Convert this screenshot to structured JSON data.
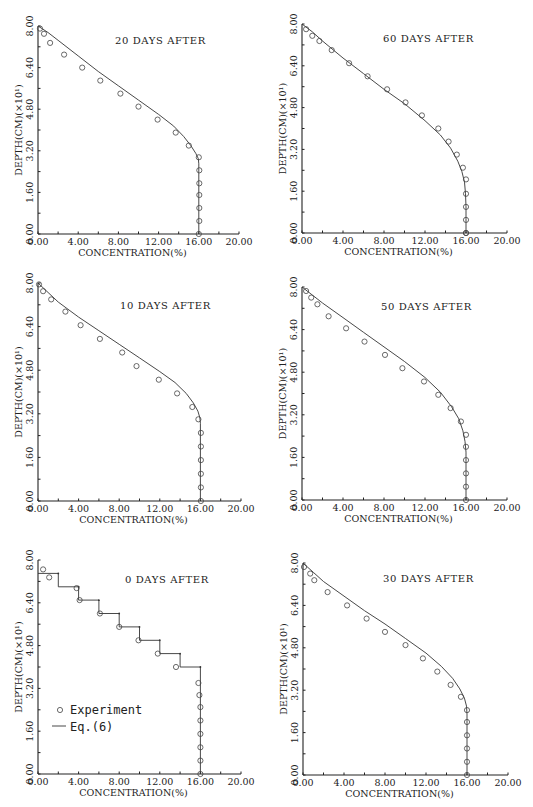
{
  "figure": {
    "legend": {
      "experiment_label": "Experiment",
      "model_label": "Eq.(6)"
    }
  },
  "chart_data": [
    {
      "id": "p20",
      "type": "scatter",
      "title": "20 DAYS AFTER",
      "xlabel": "CONCENTRATION(%)",
      "ylabel": "DEPTH(CM)(×10¹)",
      "xlim": [
        0,
        20
      ],
      "ylim": [
        0,
        8
      ],
      "xticks": [
        "0.00",
        "4.00",
        "8.00",
        "12.00",
        "16.00",
        "20.00"
      ],
      "yticks": [
        "0.00",
        "1.60",
        "3.20",
        "4.80",
        "6.40",
        "8.00"
      ],
      "frame": {
        "x0": 38,
        "x1": 239,
        "y0": 234,
        "y1": 26
      },
      "title_pos": {
        "x": 115,
        "y": 44
      },
      "series": [
        {
          "name": "Eq.(6)",
          "kind": "line",
          "x": [
            0,
            1,
            2,
            4,
            6,
            8,
            10,
            12,
            13.5,
            14.5,
            15.2,
            15.7,
            15.95,
            16,
            16
          ],
          "y": [
            8,
            7.75,
            7.45,
            6.85,
            6.25,
            5.7,
            5.15,
            4.6,
            4.15,
            3.75,
            3.4,
            3.1,
            2.9,
            2.7,
            0
          ]
        },
        {
          "name": "Experiment",
          "kind": "markers",
          "x": [
            0.2,
            0.6,
            1.2,
            2.6,
            4.4,
            6.2,
            8.2,
            10.0,
            11.9,
            13.7,
            15.0,
            16.0,
            16.05,
            16.05,
            16.05,
            16.05,
            16.05,
            16.0
          ],
          "y": [
            7.9,
            7.7,
            7.35,
            6.9,
            6.4,
            5.9,
            5.4,
            4.9,
            4.4,
            3.9,
            3.4,
            2.95,
            2.45,
            1.95,
            1.5,
            1.0,
            0.5,
            0.0
          ]
        }
      ]
    },
    {
      "id": "p60",
      "type": "scatter",
      "title": "60 DAYS AFTER",
      "xlabel": "CONCENTRATION(%)",
      "ylabel": "DEPTH(CM)(×10¹)",
      "xlim": [
        0,
        20
      ],
      "ylim": [
        0,
        8
      ],
      "xticks": [
        "0.00",
        "4.00",
        "8.00",
        "12.00",
        "16.00",
        "20.00"
      ],
      "yticks": [
        "0.00",
        "1.60",
        "3.20",
        "4.80",
        "6.40",
        "8.00"
      ],
      "frame": {
        "x0": 302,
        "x1": 507,
        "y0": 233,
        "y1": 24
      },
      "title_pos": {
        "x": 383,
        "y": 42
      },
      "series": [
        {
          "name": "Eq.(6)",
          "kind": "line",
          "x": [
            0,
            1,
            2,
            4,
            6,
            8,
            10,
            12,
            13.5,
            14.5,
            15.2,
            15.6,
            15.85,
            15.95,
            16,
            16
          ],
          "y": [
            8,
            7.7,
            7.35,
            6.7,
            6.1,
            5.5,
            4.95,
            4.3,
            3.75,
            3.25,
            2.75,
            2.35,
            1.95,
            1.5,
            1.0,
            0
          ]
        },
        {
          "name": "Experiment",
          "kind": "markers",
          "x": [
            0.4,
            1.0,
            1.7,
            2.9,
            4.6,
            6.4,
            8.3,
            10.1,
            11.7,
            13.3,
            14.3,
            15.1,
            15.7,
            16.0,
            16.0,
            16.0,
            16.0,
            16.0,
            16.0
          ],
          "y": [
            7.8,
            7.55,
            7.35,
            7.0,
            6.5,
            6.0,
            5.5,
            5.0,
            4.5,
            4.0,
            3.5,
            3.0,
            2.5,
            2.05,
            1.5,
            1.0,
            0.5,
            0.0,
            0.0
          ]
        }
      ]
    },
    {
      "id": "p10",
      "type": "scatter",
      "title": "10 DAYS AFTER",
      "xlabel": "CONCENTRATION(%)",
      "ylabel": "DEPTH(CM)(×10¹)",
      "xlim": [
        0,
        20
      ],
      "ylim": [
        0,
        8
      ],
      "xticks": [
        "0.00",
        "4.00",
        "8.00",
        "12.00",
        "16.00",
        "20.00"
      ],
      "yticks": [
        "0.00",
        "1.60",
        "3.20",
        "4.80",
        "6.40",
        "8.00"
      ],
      "frame": {
        "x0": 38,
        "x1": 241,
        "y0": 501,
        "y1": 283
      },
      "title_pos": {
        "x": 120,
        "y": 309
      },
      "series": [
        {
          "name": "Eq.(6)",
          "kind": "line",
          "x": [
            0,
            1,
            2,
            4,
            6,
            8,
            10,
            12,
            13.5,
            14.6,
            15.3,
            15.75,
            15.95,
            16,
            16
          ],
          "y": [
            8,
            7.65,
            7.3,
            6.75,
            6.25,
            5.75,
            5.25,
            4.75,
            4.35,
            3.95,
            3.6,
            3.3,
            3.05,
            2.85,
            0
          ]
        },
        {
          "name": "Experiment",
          "kind": "markers",
          "x": [
            0.1,
            0.5,
            1.3,
            2.7,
            4.2,
            6.1,
            8.3,
            9.7,
            11.9,
            13.7,
            15.2,
            15.8,
            16.05,
            16.05,
            16.05,
            16.05,
            16.05,
            16.05
          ],
          "y": [
            7.95,
            7.7,
            7.4,
            6.95,
            6.45,
            5.95,
            5.45,
            4.95,
            4.45,
            3.95,
            3.45,
            3.0,
            2.5,
            2.0,
            1.5,
            1.0,
            0.5,
            0.0
          ]
        }
      ]
    },
    {
      "id": "p50",
      "type": "scatter",
      "title": "50 DAYS AFTER",
      "xlabel": "CONCENTRATION(%)",
      "ylabel": "DEPTH(CM)(×10¹)",
      "xlim": [
        0,
        20
      ],
      "ylim": [
        0,
        8
      ],
      "xticks": [
        "0.00",
        "4.00",
        "8.00",
        "12.00",
        "16.00",
        "20.00"
      ],
      "yticks": [
        "0.00",
        "1.60",
        "3.20",
        "4.80",
        "6.40",
        "8.00"
      ],
      "frame": {
        "x0": 302,
        "x1": 507,
        "y0": 500,
        "y1": 287
      },
      "title_pos": {
        "x": 381,
        "y": 310
      },
      "series": [
        {
          "name": "Eq.(6)",
          "kind": "line",
          "x": [
            0,
            1,
            2,
            4,
            6,
            8,
            10,
            12,
            13.5,
            14.6,
            15.3,
            15.7,
            15.9,
            16,
            16
          ],
          "y": [
            8,
            7.7,
            7.4,
            6.85,
            6.3,
            5.75,
            5.2,
            4.6,
            4.05,
            3.5,
            3.05,
            2.6,
            2.2,
            1.8,
            0
          ]
        },
        {
          "name": "Experiment",
          "kind": "markers",
          "x": [
            0.4,
            0.9,
            1.5,
            2.6,
            4.3,
            6.1,
            8.1,
            9.8,
            11.9,
            13.3,
            14.5,
            15.5,
            16.0,
            16.0,
            16.0,
            16.0,
            16.0,
            16.0
          ],
          "y": [
            7.85,
            7.6,
            7.35,
            6.9,
            6.45,
            5.95,
            5.45,
            4.95,
            4.45,
            3.95,
            3.45,
            2.95,
            2.45,
            2.0,
            1.5,
            1.0,
            0.5,
            0.0
          ]
        }
      ]
    },
    {
      "id": "p0",
      "type": "scatter",
      "title": "0 DAYS AFTER",
      "xlabel": "CONCENTRATION(%)",
      "ylabel": "DEPTH(CM)(×10¹)",
      "xlim": [
        0,
        20
      ],
      "ylim": [
        0,
        8
      ],
      "xticks": [
        "0.00",
        "4.00",
        "8.00",
        "12.00",
        "16.00",
        "20.00"
      ],
      "yticks": [
        "0.00",
        "1.60",
        "3.20",
        "4.80",
        "6.40",
        "8.00"
      ],
      "frame": {
        "x0": 38,
        "x1": 241,
        "y0": 774,
        "y1": 560
      },
      "title_pos": {
        "x": 125,
        "y": 583
      },
      "legend_pos": {
        "x": 56,
        "y": 714
      },
      "series": [
        {
          "name": "Eq.(6)",
          "kind": "step",
          "x": [
            0,
            2,
            2,
            4,
            4,
            6,
            6,
            8,
            8,
            10,
            10,
            12,
            12,
            14,
            14,
            16,
            16
          ],
          "y": [
            7.5,
            7.5,
            7.0,
            7.0,
            6.5,
            6.5,
            6.0,
            6.0,
            5.5,
            5.5,
            5.0,
            5.0,
            4.5,
            4.5,
            4.0,
            4.0,
            0
          ]
        },
        {
          "name": "Experiment",
          "kind": "markers",
          "x": [
            0.5,
            1.1,
            3.8,
            4.1,
            6.1,
            8.0,
            9.9,
            11.8,
            13.6,
            15.8,
            15.9,
            16.0,
            16.0,
            16.0,
            16.0,
            16.0,
            16.0
          ],
          "y": [
            7.65,
            7.35,
            6.95,
            6.5,
            6.0,
            5.5,
            5.0,
            4.5,
            4.0,
            3.4,
            2.95,
            2.5,
            2.0,
            1.5,
            1.0,
            0.5,
            0.0
          ]
        }
      ]
    },
    {
      "id": "p30",
      "type": "scatter",
      "title": "30 DAYS AFTER",
      "xlabel": "CONCENTRATION(%)",
      "ylabel": "DEPTH(CM)(×10¹)",
      "xlim": [
        0,
        20
      ],
      "ylim": [
        0,
        8
      ],
      "xticks": [
        "0.00",
        "4.00",
        "8.00",
        "12.00",
        "16.00",
        "20.00"
      ],
      "yticks": [
        "0.00",
        "1.60",
        "3.20",
        "4.80",
        "6.40",
        "8.00"
      ],
      "frame": {
        "x0": 303,
        "x1": 508,
        "y0": 775,
        "y1": 563
      },
      "title_pos": {
        "x": 383,
        "y": 582
      },
      "series": [
        {
          "name": "Eq.(6)",
          "kind": "line",
          "x": [
            0,
            1,
            2,
            4,
            6,
            8,
            10,
            12,
            13.5,
            14.6,
            15.3,
            15.75,
            15.95,
            16,
            16
          ],
          "y": [
            8,
            7.65,
            7.3,
            6.75,
            6.2,
            5.7,
            5.15,
            4.6,
            4.1,
            3.65,
            3.25,
            2.9,
            2.6,
            2.3,
            0
          ]
        },
        {
          "name": "Experiment",
          "kind": "markers",
          "x": [
            0.1,
            0.7,
            1.1,
            2.4,
            4.3,
            6.2,
            8.0,
            10.0,
            11.7,
            13.1,
            14.4,
            15.4,
            16.0,
            16.0,
            16.0,
            16.0,
            16.0,
            16.0
          ],
          "y": [
            7.85,
            7.6,
            7.35,
            6.9,
            6.4,
            5.9,
            5.4,
            4.9,
            4.4,
            3.9,
            3.4,
            2.95,
            2.45,
            2.0,
            1.5,
            1.0,
            0.5,
            0.0
          ]
        }
      ]
    }
  ]
}
